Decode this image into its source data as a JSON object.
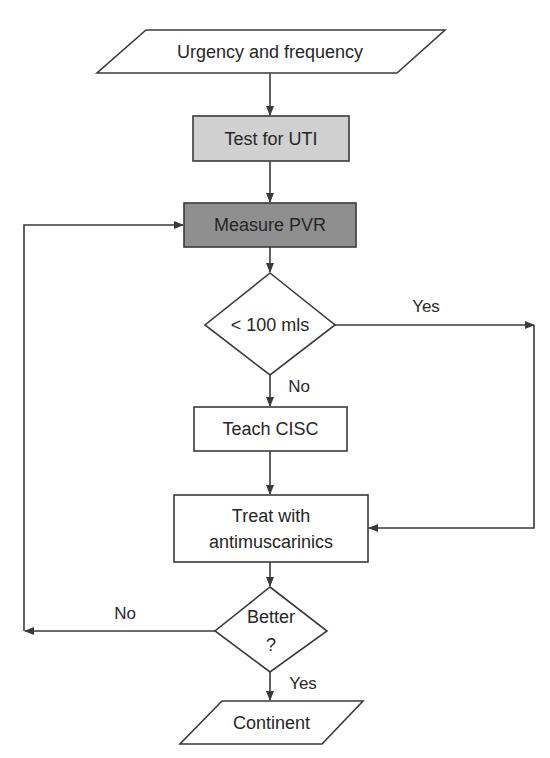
{
  "diagram": {
    "type": "flowchart",
    "colors": {
      "line": "#3a3a3a",
      "test_fill": "#d0d0d0",
      "measure_fill": "#8f8f8f",
      "default_fill": "#ffffff",
      "text": "#262626"
    },
    "nodes": [
      {
        "id": "start",
        "shape": "parallelogram",
        "text": "Urgency and frequency"
      },
      {
        "id": "test",
        "shape": "rect",
        "text": "Test for UTI"
      },
      {
        "id": "measure",
        "shape": "rect",
        "text": "Measure PVR"
      },
      {
        "id": "decision1",
        "shape": "diamond",
        "text": "< 100 mls"
      },
      {
        "id": "teach",
        "shape": "rect",
        "text": "Teach CISC"
      },
      {
        "id": "treat",
        "shape": "rect",
        "text_line1": "Treat with",
        "text_line2": "antimuscarinics"
      },
      {
        "id": "decision2",
        "shape": "diamond",
        "text_line1": "Better",
        "text_line2": "?"
      },
      {
        "id": "end",
        "shape": "parallelogram",
        "text": "Continent"
      }
    ],
    "edges": [
      {
        "from": "start",
        "to": "test",
        "label": ""
      },
      {
        "from": "test",
        "to": "measure",
        "label": ""
      },
      {
        "from": "measure",
        "to": "decision1",
        "label": ""
      },
      {
        "from": "decision1",
        "to": "treat",
        "label": "Yes"
      },
      {
        "from": "decision1",
        "to": "teach",
        "label": "No"
      },
      {
        "from": "teach",
        "to": "treat",
        "label": ""
      },
      {
        "from": "treat",
        "to": "decision2",
        "label": ""
      },
      {
        "from": "decision2",
        "to": "measure",
        "label": "No"
      },
      {
        "from": "decision2",
        "to": "end",
        "label": "Yes"
      }
    ],
    "edge_labels": {
      "d1_yes": "Yes",
      "d1_no": "No",
      "d2_no": "No",
      "d2_yes": "Yes"
    }
  }
}
